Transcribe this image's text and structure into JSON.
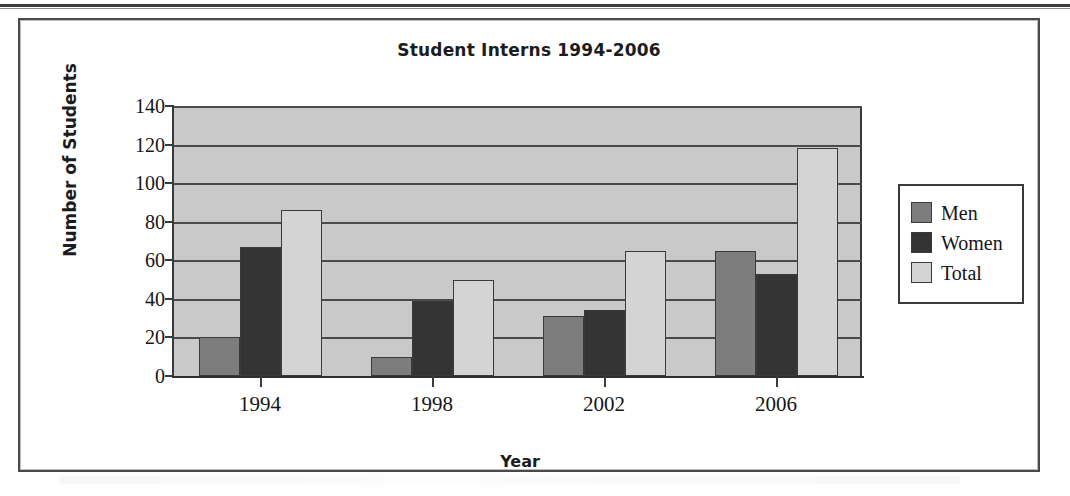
{
  "chart_data": {
    "type": "bar",
    "title": "Student Interns 1994-2006",
    "xlabel": "Year",
    "ylabel": "Number of Students",
    "categories": [
      "1994",
      "1998",
      "2002",
      "2006"
    ],
    "series": [
      {
        "name": "Men",
        "values": [
          20,
          10,
          31,
          65
        ],
        "color": "#7d7d7d"
      },
      {
        "name": "Women",
        "values": [
          67,
          39,
          34,
          53
        ],
        "color": "#343434"
      },
      {
        "name": "Total",
        "values": [
          86,
          50,
          65,
          118
        ],
        "color": "#d4d4d4"
      }
    ],
    "ylim": [
      0,
      140
    ],
    "yticks": [
      0,
      20,
      40,
      60,
      80,
      100,
      120,
      140
    ],
    "ytick_labels": [
      "0",
      "20",
      "40",
      "60",
      "80",
      "100",
      "120",
      "140"
    ],
    "grid": true,
    "legend_position": "right",
    "plot_background": "#c9c9c9"
  },
  "legend": {
    "items": [
      {
        "label": "Men"
      },
      {
        "label": "Women"
      },
      {
        "label": "Total"
      }
    ]
  }
}
